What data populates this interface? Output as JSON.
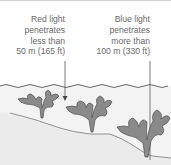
{
  "diagram": {
    "labels": {
      "red": {
        "line1": "Red light",
        "line2": "penetrates",
        "line3": "less than",
        "line4": "50 m (165 ft)"
      },
      "blue": {
        "line1": "Blue light",
        "line2": "penetrates",
        "line3": "more than",
        "line4": "100 m (330 ft)"
      }
    },
    "colors": {
      "background": "#ffffff",
      "water": "#f2f2f2",
      "seabed": "#e9e9e9",
      "seaweed_fill": "#8a8a8a",
      "seaweed_outline": "#505050",
      "text": "#6a6a6a",
      "lines": "#444444"
    },
    "icons": [
      "arrow-down-icon",
      "seaweed-icon",
      "wave-surface-icon"
    ]
  }
}
